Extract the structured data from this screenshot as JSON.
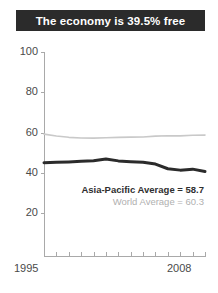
{
  "title": {
    "text": "The economy is 39.5% free"
  },
  "chart_data": {
    "type": "line",
    "title": "The economy is 39.5% free",
    "xlabel": "",
    "ylabel": "",
    "xlim": [
      1995,
      2008
    ],
    "ylim": [
      0,
      100
    ],
    "yticks": [
      100,
      80,
      60,
      40,
      20
    ],
    "xticks": [
      1995,
      2008
    ],
    "xtick_labels": [
      "1995",
      "2008"
    ],
    "grid": false,
    "legend_position": "inside-lower-right",
    "x": [
      1995,
      1996,
      1997,
      1998,
      1999,
      2000,
      2001,
      2002,
      2003,
      2004,
      2005,
      2006,
      2007,
      2008
    ],
    "series": [
      {
        "name": "World Average",
        "label": "World Average = 60.3",
        "color": "#c9c9c9",
        "width": 1.6,
        "values": [
          59.2,
          58.3,
          57.6,
          57.3,
          57.2,
          57.4,
          57.6,
          57.7,
          57.8,
          58.2,
          58.4,
          58.3,
          58.6,
          58.7
        ]
      },
      {
        "name": "Asia-Pacific Average",
        "label": "Asia-Pacific Average = 58.7",
        "color": "#2b2b2b",
        "width": 3.0,
        "values": [
          45.0,
          45.2,
          45.4,
          45.7,
          46.0,
          46.8,
          45.9,
          45.5,
          45.2,
          44.3,
          42.0,
          41.3,
          41.8,
          40.6
        ]
      }
    ],
    "annotations": [
      {
        "text": "Asia-Pacific Average = 58.7",
        "value": 58.7
      },
      {
        "text": "World Average = 60.3",
        "value": 60.3
      }
    ]
  },
  "legend": {
    "asia_pacific": "Asia-Pacific Average = 58.7",
    "world": "World Average = 60.3"
  },
  "axes": {
    "y_labels": [
      "100",
      "80",
      "60",
      "40",
      "20"
    ],
    "x_start": "1995",
    "x_end": "2008"
  },
  "colors": {
    "title_bar": "#2b2b2b",
    "title_text": "#ffffff",
    "asia_line": "#2b2b2b",
    "world_line": "#c9c9c9",
    "axis": "#a9a9a9",
    "tick_text": "#4a4a4a"
  }
}
